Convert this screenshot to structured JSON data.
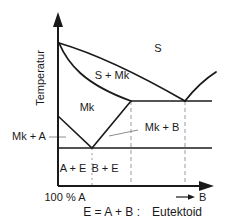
{
  "diagram": {
    "type": "phase-diagram-eutectoid",
    "axes": {
      "y_label": "Temperatur",
      "x_origin_label": "100 % A",
      "x_end_label": "B"
    },
    "regions": {
      "melt": "S",
      "melt_plus_mk": "S + Mk",
      "mk": "Mk",
      "mk_plus_a": "Mk + A",
      "mk_plus_b": "Mk + B",
      "a_plus_e": "A + E",
      "b_plus_e": "B + E"
    },
    "caption": {
      "formula": "E = A + B :",
      "term": "Eutektoid"
    },
    "colors": {
      "line": "#1a1a1a",
      "dashed_line": "#9b9b9b",
      "background": "#ffffff"
    }
  }
}
